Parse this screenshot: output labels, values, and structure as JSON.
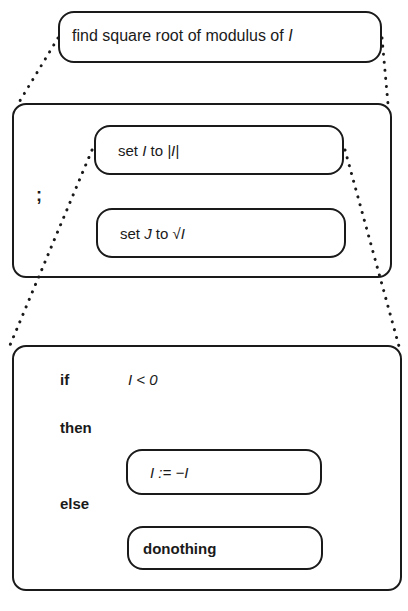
{
  "top": {
    "label": "find square root of modulus of ",
    "var": "I"
  },
  "sequence": {
    "separator": ";",
    "step1": {
      "pre": "set ",
      "var": "I",
      "mid": " to ",
      "expr": "|I|"
    },
    "step2": {
      "pre": "set ",
      "var": "J",
      "mid": " to ",
      "expr": "√I"
    }
  },
  "conditional": {
    "if_kw": "if",
    "condition": "I < 0",
    "then_kw": "then",
    "then_stmt": "I := −I",
    "else_kw": "else",
    "else_stmt": "donothing"
  }
}
